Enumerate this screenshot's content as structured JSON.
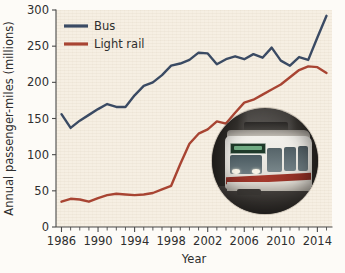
{
  "chart_data": {
    "type": "line",
    "title": "",
    "xlabel": "Year",
    "ylabel": "Annual passenger-miles (millions)",
    "xlim": [
      1985.4,
      2015.6
    ],
    "ylim": [
      0,
      300
    ],
    "yticks": [
      0,
      50,
      100,
      150,
      200,
      250,
      300
    ],
    "ytick_labels": [
      "0",
      "50",
      "100",
      "150",
      "200",
      "250",
      "300"
    ],
    "xticks_major": [
      1986,
      1990,
      1994,
      1998,
      2002,
      2006,
      2010,
      2014
    ],
    "xtick_labels": [
      "1986",
      "1990",
      "1994",
      "1998",
      "2002",
      "2006",
      "2010",
      "2014"
    ],
    "xticks_minor_step": 1,
    "grid": false,
    "legend_position": "top-left",
    "x": [
      1986,
      1987,
      1988,
      1989,
      1990,
      1991,
      1992,
      1993,
      1994,
      1995,
      1996,
      1997,
      1998,
      1999,
      2000,
      2001,
      2002,
      2003,
      2004,
      2005,
      2006,
      2007,
      2008,
      2009,
      2010,
      2011,
      2012,
      2013,
      2014,
      2015
    ],
    "series": [
      {
        "name": "Bus",
        "color": "#3a4a63",
        "values": [
          156,
          137,
          147,
          155,
          163,
          170,
          166,
          166,
          182,
          195,
          200,
          210,
          223,
          226,
          231,
          241,
          240,
          225,
          232,
          236,
          232,
          239,
          234,
          248,
          230,
          223,
          235,
          231,
          262,
          292
        ]
      },
      {
        "name": "Light rail",
        "color": "#a84432",
        "values": [
          35,
          39,
          38,
          35,
          40,
          44,
          46,
          45,
          44,
          45,
          47,
          52,
          57,
          87,
          115,
          129,
          135,
          146,
          143,
          158,
          172,
          176,
          183,
          190,
          197,
          207,
          217,
          222,
          221,
          213
        ]
      }
    ]
  },
  "legend": {
    "items": [
      {
        "label": "Bus",
        "color": "#3a4a63"
      },
      {
        "label": "Light rail",
        "color": "#a84432"
      }
    ]
  },
  "photo_inset": {
    "name": "light-rail-train-photo",
    "shape": "circle",
    "caption": ""
  },
  "colors": {
    "plot_background": "#f6efe3",
    "figure_background": "#fdfbf7",
    "axis": "#4a4a4a",
    "text": "#2e2e2e",
    "bus": "#3a4a63",
    "light_rail": "#a84432"
  }
}
